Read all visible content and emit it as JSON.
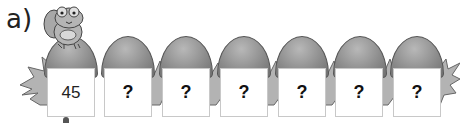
{
  "question_label": "a)",
  "boxes": [
    {
      "value": "45",
      "known": true
    },
    {
      "value": "?",
      "known": false
    },
    {
      "value": "?",
      "known": false
    },
    {
      "value": "?",
      "known": false
    },
    {
      "value": "?",
      "known": false
    },
    {
      "value": "?",
      "known": false
    },
    {
      "value": "?",
      "known": false
    }
  ],
  "illustration": {
    "character": "frog-icon",
    "platforms": "egg-shaped-stones-with-grass"
  },
  "colors": {
    "stone": "#8e8e8e",
    "grass": "#b0b0b0",
    "box_border": "#c8c8c8"
  }
}
